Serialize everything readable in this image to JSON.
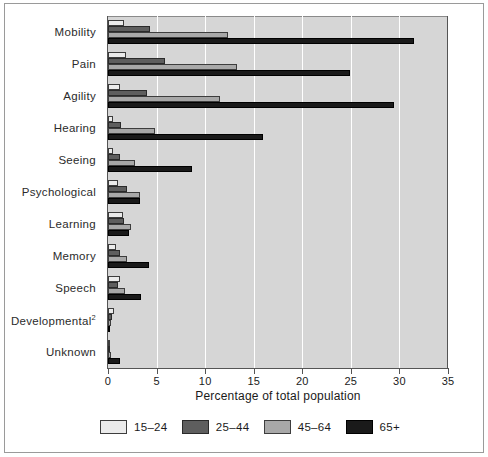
{
  "chart_data": {
    "type": "bar",
    "orientation": "horizontal",
    "title": "",
    "subtitle": "",
    "xlabel": "Percentage of total population",
    "ylabel": "",
    "xlim": [
      0,
      35
    ],
    "xticks": [
      0,
      5,
      10,
      15,
      20,
      25,
      30,
      35
    ],
    "xticklabels": [
      "0",
      "5",
      "10",
      "15",
      "20",
      "25",
      "30",
      "35"
    ],
    "grid": "vertical",
    "legend_position": "bottom",
    "categories": [
      "Mobility",
      "Pain",
      "Agility",
      "Hearing",
      "Seeing",
      "Psychological",
      "Learning",
      "Memory",
      "Speech",
      "Developmental²",
      "Unknown"
    ],
    "series": [
      {
        "name": "15–24",
        "color": "#ebebeb",
        "values": [
          1.6,
          1.9,
          1.2,
          0.5,
          0.5,
          1.0,
          1.5,
          0.8,
          1.2,
          0.6,
          0.2
        ]
      },
      {
        "name": "25–44",
        "color": "#5e5e5e",
        "values": [
          4.3,
          5.9,
          4.0,
          1.3,
          1.2,
          2.0,
          1.6,
          1.2,
          1.0,
          0.4,
          0.15
        ]
      },
      {
        "name": "45–64",
        "color": "#a8a8a8",
        "values": [
          12.4,
          13.3,
          11.5,
          4.8,
          2.8,
          3.3,
          2.4,
          2.0,
          1.7,
          0.3,
          0.3
        ]
      },
      {
        "name": "65+",
        "color": "#1a1a1a",
        "values": [
          31.5,
          24.9,
          29.4,
          16.0,
          8.6,
          3.3,
          2.2,
          4.2,
          3.4,
          0.2,
          1.2
        ]
      }
    ]
  },
  "legend": {
    "entries": [
      {
        "label": "15–24"
      },
      {
        "label": "25–44"
      },
      {
        "label": "45–64"
      },
      {
        "label": "65+"
      }
    ]
  }
}
